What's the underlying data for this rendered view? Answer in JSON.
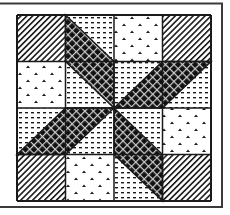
{
  "figure": {
    "title": "",
    "colors": {
      "background": "#ffffff",
      "line": "#1a1a1a",
      "frame": "#3a3a3a",
      "dark_fabric": "#111111",
      "dark_lattice": "#cfcfcf"
    },
    "frame": {
      "top_y": 3,
      "right_x": 222,
      "bottom_y": 207,
      "left_x": 0
    },
    "grid": {
      "x0": 17,
      "y0": 15,
      "x1": 211,
      "y1": 201,
      "cols": 4,
      "rows": 4
    },
    "patterns": {
      "hatch": "diagonal-hatch",
      "motif": "caret-dots",
      "dash": "horizontal-dashes",
      "lattice": "dark-crosshatch"
    },
    "cells": [
      [
        "hatch",
        "dash-split",
        "motif",
        "hatch"
      ],
      [
        "motif",
        "dash-split",
        "dash-split",
        "dash-split"
      ],
      [
        "dash-split",
        "dash-split",
        "dash-split",
        "motif"
      ],
      [
        "hatch",
        "motif",
        "dash-split",
        "hatch"
      ]
    ],
    "blades": [
      {
        "name": "top-blade",
        "points": [
          [
            1,
            0
          ],
          [
            2,
            1
          ],
          [
            2,
            2
          ],
          [
            1,
            1
          ]
        ]
      },
      {
        "name": "right-blade",
        "points": [
          [
            2,
            2
          ],
          [
            3,
            1
          ],
          [
            4,
            1
          ],
          [
            3,
            2
          ]
        ]
      },
      {
        "name": "bottom-blade",
        "points": [
          [
            2,
            2
          ],
          [
            3,
            3
          ],
          [
            3,
            4
          ],
          [
            2,
            3
          ]
        ]
      },
      {
        "name": "left-blade",
        "points": [
          [
            2,
            2
          ],
          [
            1,
            3
          ],
          [
            0,
            3
          ],
          [
            1,
            2
          ]
        ]
      }
    ]
  }
}
